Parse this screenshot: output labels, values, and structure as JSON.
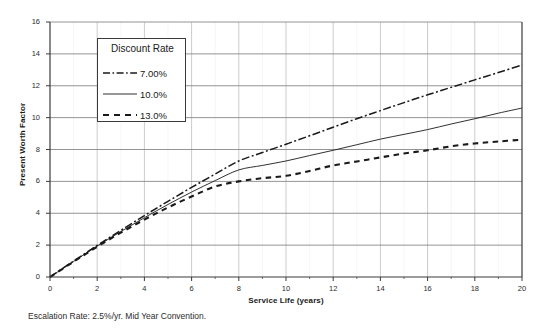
{
  "chart_data": {
    "type": "line",
    "title": "",
    "xlabel": "Service Life (years)",
    "ylabel": "Present Worth Factor",
    "xlim": [
      0,
      20
    ],
    "ylim": [
      0,
      16
    ],
    "xticks": [
      0,
      2,
      4,
      6,
      8,
      10,
      12,
      14,
      16,
      18,
      20
    ],
    "yticks": [
      0,
      2,
      4,
      6,
      8,
      10,
      12,
      14,
      16
    ],
    "grid": "horizontal-major-and-vertical-major",
    "legend_position": "upper-left-inside",
    "legend_title": "Discount Rate",
    "footnote": "Escalation Rate: 2.5%/yr. Mid Year Convention.",
    "x": [
      0,
      1,
      2,
      3,
      4,
      5,
      6,
      7,
      8,
      9,
      10,
      11,
      12,
      13,
      14,
      15,
      16,
      17,
      18,
      19,
      20
    ],
    "series": [
      {
        "name": "7.00%",
        "style": "dash-dot",
        "color": "#1a1a1a",
        "values": [
          0,
          1.0,
          1.98,
          2.93,
          3.85,
          4.75,
          5.62,
          6.46,
          7.28,
          7.81,
          8.33,
          8.86,
          9.4,
          9.93,
          10.44,
          10.94,
          11.43,
          11.9,
          12.37,
          12.83,
          13.3
        ]
      },
      {
        "name": "10.0%",
        "style": "solid",
        "color": "#1a1a1a",
        "values": [
          0,
          0.98,
          1.94,
          2.85,
          3.72,
          4.55,
          5.33,
          6.05,
          6.72,
          7.0,
          7.28,
          7.62,
          7.95,
          8.3,
          8.65,
          8.95,
          9.25,
          9.6,
          9.93,
          10.28,
          10.6
        ]
      },
      {
        "name": "13.0%",
        "style": "dashed",
        "color": "#1a1a1a",
        "values": [
          0,
          0.96,
          1.9,
          2.78,
          3.6,
          4.36,
          5.05,
          5.68,
          6.0,
          6.2,
          6.35,
          6.65,
          7.0,
          7.25,
          7.5,
          7.75,
          7.95,
          8.2,
          8.38,
          8.5,
          8.62
        ]
      }
    ]
  },
  "axes": {
    "y_title": "Present Worth Factor",
    "x_title": "Service Life (years)"
  },
  "legend": {
    "title": "Discount Rate",
    "entries": [
      {
        "label": "7.00%",
        "style": "dash-dot"
      },
      {
        "label": "10.0%",
        "style": "solid"
      },
      {
        "label": "13.0%",
        "style": "dashed"
      }
    ]
  },
  "footnote": {
    "text": "Escalation Rate: 2.5%/yr. Mid Year Convention."
  },
  "colors": {
    "background": "#ffffff",
    "axis": "#3a3a3a",
    "gridline_major": "#888888",
    "gridline_minor": "#cccccc",
    "series": "#1a1a1a",
    "text": "#1a1a1a"
  }
}
